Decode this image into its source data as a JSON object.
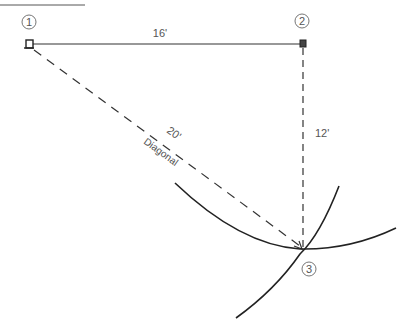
{
  "diagram": {
    "type": "layout-3-4-5-triangle",
    "points": [
      {
        "id": "1",
        "label": "1"
      },
      {
        "id": "2",
        "label": "2"
      },
      {
        "id": "3",
        "label": "3"
      }
    ],
    "edges": [
      {
        "from": "1",
        "to": "2",
        "label": "16'",
        "style": "solid"
      },
      {
        "from": "2",
        "to": "3",
        "label": "12'",
        "style": "dashed"
      },
      {
        "from": "1",
        "to": "3",
        "label": "20'",
        "sublabel": "Diagonal",
        "style": "dashed"
      }
    ],
    "arcs": [
      {
        "center": "1",
        "radius_label": "20'"
      },
      {
        "center": "2",
        "radius_label": "12'"
      }
    ]
  },
  "colors": {
    "line": "#333333",
    "text": "#555555",
    "background": "#ffffff"
  }
}
